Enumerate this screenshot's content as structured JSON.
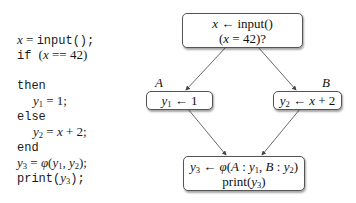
{
  "code": {
    "lines": [
      {
        "id": "l1",
        "parts": [
          {
            "t": "math",
            "v": "x"
          },
          {
            "t": "rm",
            "v": " = "
          },
          {
            "t": "mono",
            "v": "input();"
          }
        ]
      },
      {
        "id": "l2",
        "parts": [
          {
            "t": "mono",
            "v": "if "
          },
          {
            "t": "rm",
            "v": "("
          },
          {
            "t": "math",
            "v": "x"
          },
          {
            "t": "rm",
            "v": " == 42)"
          }
        ]
      },
      {
        "id": "l3",
        "parts": [
          {
            "t": "mono",
            "v": "then"
          }
        ]
      },
      {
        "id": "l4",
        "parts": [
          {
            "t": "math",
            "v": "y"
          },
          {
            "t": "sub",
            "v": "1"
          },
          {
            "t": "rm",
            "v": " = 1;"
          }
        ],
        "indent": true
      },
      {
        "id": "l5",
        "parts": [
          {
            "t": "mono",
            "v": "else"
          }
        ]
      },
      {
        "id": "l6",
        "parts": [
          {
            "t": "math",
            "v": "y"
          },
          {
            "t": "sub",
            "v": "2"
          },
          {
            "t": "rm",
            "v": " = "
          },
          {
            "t": "math",
            "v": "x"
          },
          {
            "t": "rm",
            "v": " + 2;"
          }
        ],
        "indent": true
      },
      {
        "id": "l7",
        "parts": [
          {
            "t": "mono",
            "v": "end"
          }
        ]
      },
      {
        "id": "l8",
        "parts": [
          {
            "t": "math",
            "v": "y"
          },
          {
            "t": "sub",
            "v": "3"
          },
          {
            "t": "rm",
            "v": " = "
          },
          {
            "t": "math",
            "v": "φ"
          },
          {
            "t": "rm",
            "v": "("
          },
          {
            "t": "math",
            "v": "y"
          },
          {
            "t": "sub",
            "v": "1"
          },
          {
            "t": "rm",
            "v": ", "
          },
          {
            "t": "math",
            "v": "y"
          },
          {
            "t": "sub",
            "v": "2"
          },
          {
            "t": "rm",
            "v": ");"
          }
        ]
      },
      {
        "id": "l9",
        "parts": [
          {
            "t": "mono",
            "v": "print("
          },
          {
            "t": "math",
            "v": "y"
          },
          {
            "t": "sub",
            "v": "3"
          },
          {
            "t": "mono",
            "v": ");"
          }
        ]
      }
    ],
    "tops": [
      32,
      47,
      77,
      93,
      108,
      124,
      139,
      155,
      170
    ]
  },
  "cfg": {
    "entry": {
      "line1": "x ← input()",
      "line2": "(x = 42)?"
    },
    "block_a": {
      "label": "A",
      "text": "y1 ← 1"
    },
    "block_b": {
      "label": "B",
      "text": "y2 ← x + 2"
    },
    "merge": {
      "line1": "y3 ← φ(A : y1, B : y2)",
      "line2": "print(y3)"
    }
  },
  "colors": {
    "edge": "#444444",
    "border": "#555555",
    "text": "#111111"
  }
}
